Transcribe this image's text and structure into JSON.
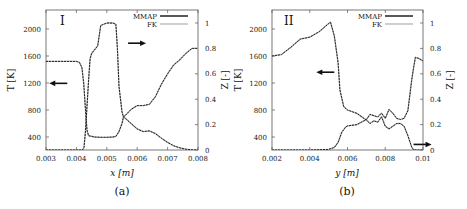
{
  "chart_data": [
    {
      "type": "line",
      "panel_tag": "I",
      "caption": "(a)",
      "xlabel": "x [m]",
      "xlabel_var": "x",
      "ylabel_left": "T [K]",
      "ylabel_right": "Z [-]",
      "xlim": [
        0.003,
        0.008
      ],
      "ylim_left": [
        200,
        2270
      ],
      "ylim_right": [
        0,
        1.1
      ],
      "xticks": [
        "0.003",
        "0.004",
        "0.005",
        "0.006",
        "0.007",
        "0.008"
      ],
      "xtick_values": [
        0.003,
        0.004,
        0.005,
        0.006,
        0.007,
        0.008
      ],
      "yticks_left": [
        "400",
        "800",
        "1200",
        "1600",
        "2000"
      ],
      "ytick_values_left": [
        400,
        800,
        1200,
        1600,
        2000
      ],
      "yticks_right": [
        "0",
        "0.2",
        "0.4",
        "0.6",
        "0.8",
        "1"
      ],
      "ytick_values_right": [
        0,
        0.2,
        0.4,
        0.6,
        0.8,
        1
      ],
      "legend": [
        "MMAP",
        "FK"
      ],
      "legend_position": "upper right",
      "grid": false,
      "annotations": [
        {
          "text": "arrow pointing left",
          "target": "T axis",
          "x": 0.0037,
          "T": 1195
        },
        {
          "text": "arrow pointing right",
          "target": "Z axis",
          "x": 0.0057,
          "T": 1790
        }
      ],
      "series": [
        {
          "name": "T (MMAP)",
          "axis": "left",
          "color": "#222222",
          "dash": "2,1",
          "x": [
            0.003,
            0.0035,
            0.004,
            0.0041,
            0.00418,
            0.00424,
            0.0043,
            0.00435,
            0.0044,
            0.0046,
            0.0048,
            0.005,
            0.0052,
            0.0053,
            0.0054,
            0.0055,
            0.00555,
            0.0056,
            0.0058,
            0.006,
            0.0062,
            0.0064,
            0.0066,
            0.0068,
            0.007,
            0.0072,
            0.0074,
            0.0076,
            0.0078,
            0.008
          ],
          "values": [
            1520,
            1520,
            1520,
            1505,
            1430,
            1200,
            800,
            500,
            420,
            400,
            395,
            395,
            400,
            410,
            480,
            600,
            700,
            680,
            600,
            520,
            480,
            490,
            450,
            380,
            320,
            270,
            240,
            220,
            210,
            205
          ]
        },
        {
          "name": "T (FK)",
          "axis": "left",
          "color": "#aaaaaa",
          "dash": "",
          "x": [
            0.003,
            0.0035,
            0.004,
            0.0041,
            0.00418,
            0.00424,
            0.0043,
            0.00435,
            0.0044,
            0.0046,
            0.0048,
            0.005,
            0.0052,
            0.0053,
            0.0054,
            0.0055,
            0.00555,
            0.0056,
            0.0058,
            0.006,
            0.0062,
            0.0064,
            0.0066,
            0.0068,
            0.007,
            0.0072,
            0.0074,
            0.0076,
            0.0078,
            0.008
          ],
          "values": [
            1520,
            1520,
            1520,
            1505,
            1430,
            1200,
            800,
            500,
            420,
            400,
            395,
            395,
            400,
            410,
            480,
            600,
            700,
            680,
            600,
            520,
            480,
            490,
            450,
            380,
            320,
            270,
            240,
            220,
            210,
            205
          ]
        },
        {
          "name": "Z (MMAP)",
          "axis": "right",
          "color": "#222222",
          "dash": "2,1",
          "x": [
            0.003,
            0.0042,
            0.00425,
            0.0043,
            0.0044,
            0.00445,
            0.0045,
            0.0047,
            0.0048,
            0.005,
            0.0052,
            0.0053,
            0.00535,
            0.0054,
            0.0055,
            0.00555,
            0.0056,
            0.0058,
            0.006,
            0.0062,
            0.0064,
            0.0066,
            0.0068,
            0.007,
            0.0072,
            0.0074,
            0.0076,
            0.0078,
            0.008
          ],
          "values": [
            0,
            0,
            0.02,
            0.15,
            0.55,
            0.72,
            0.76,
            0.82,
            0.98,
            1.0,
            1.0,
            0.99,
            0.8,
            0.5,
            0.3,
            0.26,
            0.27,
            0.32,
            0.35,
            0.35,
            0.36,
            0.42,
            0.52,
            0.6,
            0.67,
            0.71,
            0.76,
            0.8,
            0.8
          ]
        },
        {
          "name": "Z (FK)",
          "axis": "right",
          "color": "#aaaaaa",
          "dash": "",
          "x": [
            0.003,
            0.0042,
            0.00425,
            0.0043,
            0.0044,
            0.00445,
            0.0045,
            0.0047,
            0.0048,
            0.005,
            0.0052,
            0.0053,
            0.00535,
            0.0054,
            0.0055,
            0.00555,
            0.0056,
            0.0058,
            0.006,
            0.0062,
            0.0064,
            0.0066,
            0.0068,
            0.007,
            0.0072,
            0.0074,
            0.0076,
            0.0078,
            0.008
          ],
          "values": [
            0,
            0,
            0.02,
            0.15,
            0.55,
            0.72,
            0.76,
            0.82,
            0.98,
            1.0,
            1.0,
            0.99,
            0.8,
            0.5,
            0.3,
            0.26,
            0.27,
            0.32,
            0.35,
            0.35,
            0.36,
            0.42,
            0.52,
            0.6,
            0.67,
            0.71,
            0.76,
            0.8,
            0.8
          ]
        }
      ]
    },
    {
      "type": "line",
      "panel_tag": "II",
      "caption": "(b)",
      "xlabel": "y [m]",
      "xlabel_var": "y",
      "ylabel_left": "T [K]",
      "ylabel_right": "Z [-]",
      "xlim": [
        0.002,
        0.01
      ],
      "ylim_left": [
        200,
        2270
      ],
      "ylim_right": [
        0,
        1.1
      ],
      "xticks": [
        "0.002",
        "0.004",
        "0.006",
        "0.008",
        "0.01"
      ],
      "xtick_values": [
        0.002,
        0.004,
        0.006,
        0.008,
        0.01
      ],
      "yticks_left": [
        "400",
        "800",
        "1200",
        "1600",
        "2000"
      ],
      "ytick_values_left": [
        400,
        800,
        1200,
        1600,
        2000
      ],
      "yticks_right": [
        "0",
        "0.2",
        "0.4",
        "0.6",
        "0.8",
        "1"
      ],
      "ytick_values_right": [
        0,
        0.2,
        0.4,
        0.6,
        0.8,
        1
      ],
      "legend": [
        "MMAP",
        "FK"
      ],
      "legend_position": "upper right",
      "grid": false,
      "annotations": [
        {
          "text": "arrow pointing left",
          "target": "T axis",
          "x": 0.0053,
          "T": 1360
        },
        {
          "text": "arrow pointing right",
          "target": "Z axis",
          "x": 0.0095,
          "T": 290
        }
      ],
      "series": [
        {
          "name": "T (MMAP)",
          "axis": "left",
          "color": "#222222",
          "dash": "2,1",
          "x": [
            0.002,
            0.0025,
            0.003,
            0.0035,
            0.004,
            0.0045,
            0.005,
            0.0051,
            0.0053,
            0.0055,
            0.0056,
            0.0058,
            0.006,
            0.0065,
            0.007,
            0.0072,
            0.0074,
            0.0076,
            0.0078,
            0.008,
            0.0082,
            0.0084,
            0.0086,
            0.0088,
            0.009,
            0.0092,
            0.0094,
            0.0095,
            0.0097,
            0.01
          ],
          "values": [
            1600,
            1620,
            1730,
            1850,
            1880,
            1960,
            2080,
            2100,
            1900,
            1500,
            1100,
            850,
            800,
            750,
            650,
            600,
            640,
            620,
            700,
            560,
            520,
            560,
            600,
            600,
            560,
            420,
            250,
            210,
            200,
            200
          ]
        },
        {
          "name": "T (FK)",
          "axis": "left",
          "color": "#aaaaaa",
          "dash": "",
          "x": [
            0.002,
            0.0025,
            0.003,
            0.0035,
            0.004,
            0.0045,
            0.005,
            0.0051,
            0.0053,
            0.0055,
            0.0056,
            0.0058,
            0.006,
            0.0065,
            0.007,
            0.0072,
            0.0074,
            0.0076,
            0.0078,
            0.008,
            0.0082,
            0.0084,
            0.0086,
            0.0088,
            0.009,
            0.0092,
            0.0094,
            0.0095,
            0.0097,
            0.01
          ],
          "values": [
            1600,
            1620,
            1730,
            1850,
            1880,
            1960,
            2080,
            2100,
            1900,
            1500,
            1100,
            850,
            800,
            750,
            650,
            600,
            640,
            620,
            700,
            560,
            520,
            560,
            600,
            600,
            560,
            420,
            250,
            210,
            200,
            200
          ]
        },
        {
          "name": "Z (MMAP)",
          "axis": "right",
          "color": "#222222",
          "dash": "2,1",
          "x": [
            0.002,
            0.004,
            0.005,
            0.0053,
            0.0055,
            0.0057,
            0.0059,
            0.006,
            0.0065,
            0.007,
            0.0072,
            0.0074,
            0.0076,
            0.0078,
            0.008,
            0.0082,
            0.0084,
            0.0086,
            0.0088,
            0.009,
            0.0092,
            0.0094,
            0.0095,
            0.0096,
            0.0098,
            0.01
          ],
          "values": [
            0,
            0,
            0.005,
            0.02,
            0.06,
            0.14,
            0.18,
            0.19,
            0.2,
            0.24,
            0.28,
            0.27,
            0.26,
            0.29,
            0.25,
            0.32,
            0.29,
            0.25,
            0.24,
            0.25,
            0.31,
            0.55,
            0.65,
            0.73,
            0.72,
            0.7
          ]
        },
        {
          "name": "Z (FK)",
          "axis": "right",
          "color": "#aaaaaa",
          "dash": "",
          "x": [
            0.002,
            0.004,
            0.005,
            0.0053,
            0.0055,
            0.0057,
            0.0059,
            0.006,
            0.0065,
            0.007,
            0.0072,
            0.0074,
            0.0076,
            0.0078,
            0.008,
            0.0082,
            0.0084,
            0.0086,
            0.0088,
            0.009,
            0.0092,
            0.0094,
            0.0095,
            0.0096,
            0.0098,
            0.01
          ],
          "values": [
            0,
            0,
            0.005,
            0.02,
            0.06,
            0.14,
            0.18,
            0.19,
            0.2,
            0.24,
            0.28,
            0.27,
            0.26,
            0.29,
            0.25,
            0.32,
            0.29,
            0.25,
            0.24,
            0.25,
            0.31,
            0.55,
            0.65,
            0.73,
            0.72,
            0.7
          ]
        }
      ]
    }
  ],
  "layout": {
    "panels": [
      {
        "left": 46,
        "right": 198,
        "top": 10,
        "bottom": 150,
        "T_ref_px": [
          137,
          29
        ],
        "T_ref": [
          400,
          2000
        ],
        "Z_px_zero": 150,
        "Z_px_one": 23,
        "caption_x": 122,
        "caption_y": 195,
        "xlabel_x": 122,
        "xlabel_y": 176,
        "tag_x": 60,
        "tag_y": 25,
        "ylabel_left_x": 14,
        "ylabel_right_x": 228,
        "legend_x": 145,
        "legend_y": 16
      },
      {
        "left": 272,
        "right": 423,
        "top": 10,
        "bottom": 150,
        "T_ref_px": [
          137,
          29
        ],
        "T_ref": [
          400,
          2000
        ],
        "Z_px_zero": 150,
        "Z_px_one": 23,
        "caption_x": 347,
        "caption_y": 195,
        "xlabel_x": 347,
        "xlabel_y": 176,
        "tag_x": 284,
        "tag_y": 25,
        "ylabel_left_x": 241,
        "ylabel_right_x": 453,
        "legend_x": 370,
        "legend_y": 16
      }
    ]
  }
}
